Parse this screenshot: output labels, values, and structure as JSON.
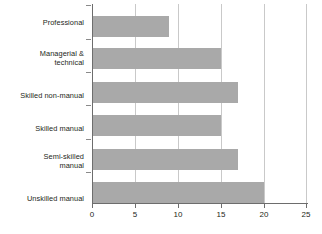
{
  "chart_data": {
    "type": "bar",
    "orientation": "horizontal",
    "title": "",
    "subtitle": "",
    "xlabel": "",
    "ylabel": "",
    "categories": [
      "Professional",
      "Managerial & technical",
      "Skilled non-manual",
      "Skilled manual",
      "Semi-skilled manual",
      "Unskilled manual"
    ],
    "category_lines": [
      [
        "Professional"
      ],
      [
        "Managerial &",
        "technical"
      ],
      [
        "Skilled non-manual"
      ],
      [
        "Skilled manual"
      ],
      [
        "Semi-skilled",
        "manual"
      ],
      [
        "Unskilled manual"
      ]
    ],
    "values": [
      9,
      15,
      17,
      15,
      17,
      20
    ],
    "xlim": [
      0,
      25
    ],
    "xticks": [
      0,
      5,
      10,
      15,
      20,
      25
    ],
    "xtick_labels": [
      "0",
      "5",
      "10",
      "15",
      "20",
      "25"
    ],
    "grid": true,
    "grid_axis": "x",
    "legend": false,
    "bar_color": "#a9a9a9",
    "gridline_color": "#c9c9c9",
    "axis_color": "#6d6d6d",
    "text_color": "#231f20",
    "background_color": "#ffffff"
  }
}
